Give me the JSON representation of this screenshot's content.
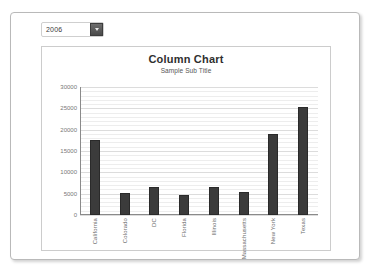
{
  "window": {
    "background": "#ffffff",
    "panel_border": "#b9b9b9"
  },
  "controls": {
    "year_filter": {
      "label": "year-filter",
      "selected": "2006",
      "dropdown_icon": "chevron-down-icon"
    }
  },
  "chart_data": {
    "type": "bar",
    "title": "Column Chart",
    "subtitle": "Sample Sub Title",
    "xlabel": "",
    "ylabel": "",
    "ylim": [
      0,
      30000
    ],
    "grid": true,
    "legend": "none",
    "bar_color": "#3b3b3b",
    "y_ticks": [
      30000,
      25000,
      20000,
      15000,
      10000,
      5000,
      0
    ],
    "y_tick_labels": [
      "30000",
      "25000",
      "20000",
      "15000",
      "10000",
      "5000",
      "0"
    ],
    "categories": [
      "California",
      "Colorado",
      "DC",
      "Florida",
      "Illinois",
      "Massachusetts",
      "New York",
      "Texas"
    ],
    "values": [
      17600,
      5200,
      6500,
      4800,
      6600,
      5400,
      19000,
      25200
    ]
  }
}
